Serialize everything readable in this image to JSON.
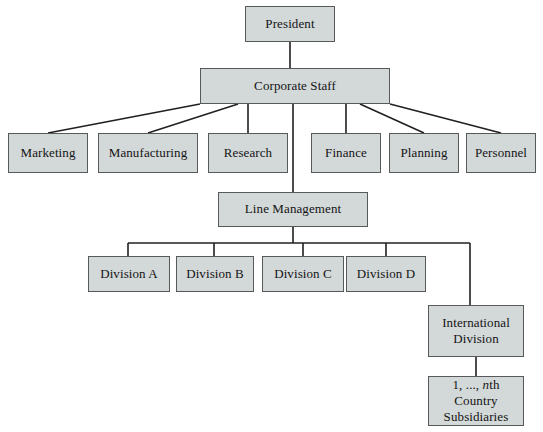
{
  "diagram": {
    "type": "org-chart",
    "colors": {
      "box_fill": "#d3d8d9",
      "box_border": "#58595b",
      "connector": "#231f20",
      "background": "#ffffff",
      "text": "#141414"
    },
    "nodes": {
      "president": {
        "label": "President",
        "x": 245,
        "y": 6,
        "w": 90,
        "h": 36
      },
      "corporate_staff": {
        "label": "Corporate Staff",
        "x": 200,
        "y": 68,
        "w": 190,
        "h": 36
      },
      "marketing": {
        "label": "Marketing",
        "x": 8,
        "y": 133,
        "w": 80,
        "h": 40
      },
      "manufacturing": {
        "label": "Manufacturing",
        "x": 98,
        "y": 133,
        "w": 100,
        "h": 40
      },
      "research": {
        "label": "Research",
        "x": 208,
        "y": 133,
        "w": 80,
        "h": 40
      },
      "finance": {
        "label": "Finance",
        "x": 311,
        "y": 133,
        "w": 70,
        "h": 40
      },
      "planning": {
        "label": "Planning",
        "x": 389,
        "y": 133,
        "w": 70,
        "h": 40
      },
      "personnel": {
        "label": "Personnel",
        "x": 466,
        "y": 133,
        "w": 70,
        "h": 40
      },
      "line_management": {
        "label": "Line Management",
        "x": 218,
        "y": 192,
        "w": 150,
        "h": 35
      },
      "division_a": {
        "label": "Division A",
        "x": 88,
        "y": 256,
        "w": 82,
        "h": 36
      },
      "division_b": {
        "label": "Division B",
        "x": 176,
        "y": 256,
        "w": 78,
        "h": 36
      },
      "division_c": {
        "label": "Division C",
        "x": 262,
        "y": 256,
        "w": 82,
        "h": 36
      },
      "division_d": {
        "label": "Division D",
        "x": 346,
        "y": 256,
        "w": 80,
        "h": 36
      },
      "international_division": {
        "line1": "International",
        "line2": "Division",
        "x": 428,
        "y": 305,
        "w": 96,
        "h": 52
      },
      "country_subsidiaries": {
        "line1_prefix": "1, ..., ",
        "line1_italic": "n",
        "line1_suffix": "th",
        "line2": "Country",
        "line3": "Subsidiaries",
        "x": 428,
        "y": 376,
        "w": 96,
        "h": 50
      }
    }
  }
}
